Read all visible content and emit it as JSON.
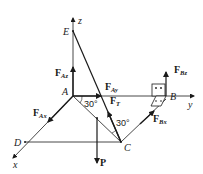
{
  "diagram": {
    "points": {
      "A": "A",
      "B": "B",
      "C": "C",
      "D": "D",
      "E": "E"
    },
    "axes": {
      "x": "x",
      "y": "y",
      "z": "z"
    },
    "forces": {
      "FAz": {
        "main": "F",
        "sub": "Az"
      },
      "FAy": {
        "main": "F",
        "sub": "Ay"
      },
      "FAx": {
        "main": "F",
        "sub": "Ax"
      },
      "FT": {
        "main": "F",
        "sub": "T"
      },
      "FBz": {
        "main": "F",
        "sub": "Bz"
      },
      "FBx": {
        "main": "F",
        "sub": "Bx"
      },
      "P": {
        "main": "P"
      }
    },
    "angles": {
      "a1": "30°",
      "a2": "30°"
    },
    "colors": {
      "line": "#1a1a1a",
      "background": "#ffffff"
    }
  }
}
